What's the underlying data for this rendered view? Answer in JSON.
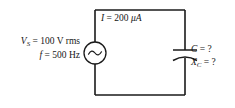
{
  "figure": {
    "type": "schematic",
    "background_color": "#ffffff",
    "line_color": "#1a1a1a",
    "text_color": "#161616"
  },
  "source": {
    "symbol": "ac-voltage-source",
    "voltage_var": "V",
    "voltage_subscript": "S",
    "voltage_equals": "= 100 V rms",
    "voltage_value": "100",
    "voltage_unit": "V rms",
    "frequency_var": "f",
    "frequency_equals": "= 500 Hz",
    "frequency_value": "500",
    "frequency_unit": "Hz"
  },
  "current": {
    "var": "I",
    "equals": "= 200",
    "value": "200",
    "unit": "μA",
    "full": "I = 200 μA"
  },
  "capacitor": {
    "symbol": "capacitor-curved-plate",
    "capacitance_var": "C",
    "capacitance_equals": "= ?",
    "capacitance_value": "?",
    "reactance_var": "X",
    "reactance_subscript": "C",
    "reactance_equals": "= ?",
    "reactance_value": "?"
  }
}
